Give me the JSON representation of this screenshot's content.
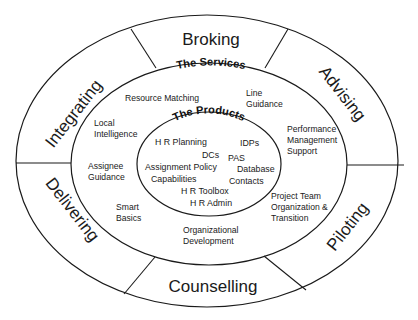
{
  "diagram": {
    "outer_ring": {
      "segments": [
        {
          "label": "Broking"
        },
        {
          "label": "Advising"
        },
        {
          "label": "Piloting"
        },
        {
          "label": "Counselling"
        },
        {
          "label": "Delivering"
        },
        {
          "label": "Integrating"
        }
      ]
    },
    "services": {
      "title": "The Services",
      "items": [
        {
          "lines": [
            "Resource Matching"
          ]
        },
        {
          "lines": [
            "Line",
            "Guidance"
          ]
        },
        {
          "lines": [
            "Local",
            "Intelligence"
          ]
        },
        {
          "lines": [
            "Performance",
            "Management",
            "Support"
          ]
        },
        {
          "lines": [
            "Assignee",
            "Guidance"
          ]
        },
        {
          "lines": [
            "Smart",
            "Basics"
          ]
        },
        {
          "lines": [
            "Project Team",
            "Organization &",
            "Transition"
          ]
        },
        {
          "lines": [
            "Organizational",
            "Development"
          ]
        }
      ]
    },
    "products": {
      "title": "The Products",
      "items": [
        {
          "label": "H R Planning"
        },
        {
          "label": "IDPs"
        },
        {
          "label": "DCs"
        },
        {
          "label": "PAS"
        },
        {
          "label": "Assignment Policy"
        },
        {
          "label": "Database"
        },
        {
          "label": "Capabilities"
        },
        {
          "label": "Contacts"
        },
        {
          "label": "H R Toolbox"
        },
        {
          "label": "H R Admin"
        }
      ]
    },
    "colors": {
      "stroke": "#1a1a1a",
      "background": "#ffffff",
      "text": "#1a1a1a"
    }
  }
}
